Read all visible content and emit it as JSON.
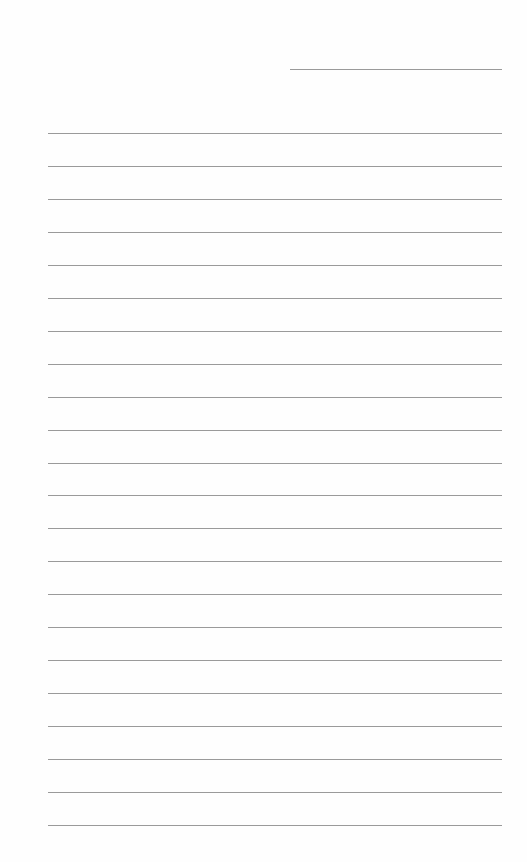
{
  "document": {
    "type": "lined-paper",
    "background_color": "#ffffff",
    "line_color": "#9a9a9a",
    "header_line": {
      "x": 290,
      "y": 69,
      "width": 212,
      "text": ""
    },
    "lines": {
      "count": 22,
      "x": 48,
      "width": 454,
      "start_y": 133,
      "spacing": 32.95,
      "texts": [
        "",
        "",
        "",
        "",
        "",
        "",
        "",
        "",
        "",
        "",
        "",
        "",
        "",
        "",
        "",
        "",
        "",
        "",
        "",
        "",
        "",
        ""
      ]
    }
  }
}
